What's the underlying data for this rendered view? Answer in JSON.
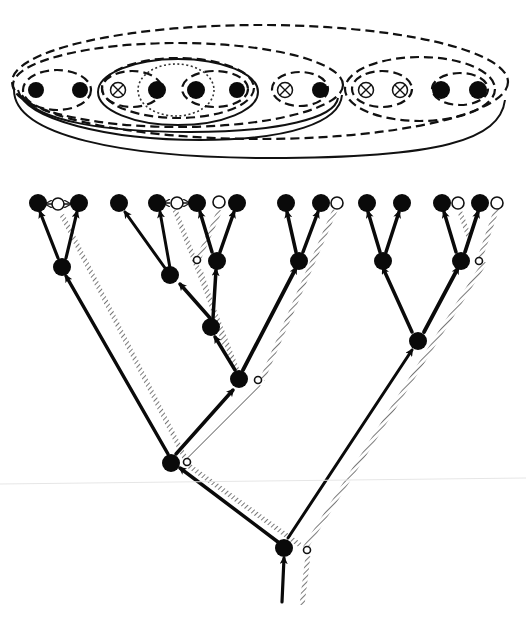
{
  "figure": {
    "top_panel": {
      "name": "nested-set-diagram",
      "groups": [
        {
          "id": "outer",
          "style": "dashed",
          "members": "all"
        },
        {
          "id": "left-major",
          "style": "solid-double",
          "members": [
            "A",
            "B",
            "C",
            "D",
            "E",
            "F",
            "G",
            "H"
          ]
        },
        {
          "id": "AB",
          "style": "dashed+hatched",
          "members": [
            "A",
            "B"
          ]
        },
        {
          "id": "CDEF",
          "style": "solid+dashed",
          "members": [
            "C",
            "D",
            "E",
            "F"
          ]
        },
        {
          "id": "CD",
          "style": "dashed",
          "members": [
            "C",
            "D"
          ]
        },
        {
          "id": "EF",
          "style": "dashed",
          "members": [
            "E",
            "F"
          ]
        },
        {
          "id": "DE",
          "style": "dotted+stippled",
          "members": [
            "D",
            "E"
          ]
        },
        {
          "id": "GH",
          "style": "dashed",
          "members": [
            "G",
            "H"
          ]
        },
        {
          "id": "right-major",
          "style": "dashed",
          "members": [
            "I",
            "J",
            "K",
            "L"
          ]
        },
        {
          "id": "IJ",
          "style": "dashed",
          "members": [
            "I",
            "J"
          ]
        },
        {
          "id": "KL",
          "style": "dashed+hatched",
          "members": [
            "K",
            "L"
          ]
        }
      ],
      "taxa": [
        {
          "id": "A",
          "symbol": "filled"
        },
        {
          "id": "B",
          "symbol": "filled"
        },
        {
          "id": "C",
          "symbol": "crossed-circle"
        },
        {
          "id": "D",
          "symbol": "filled"
        },
        {
          "id": "E",
          "symbol": "filled"
        },
        {
          "id": "F",
          "symbol": "filled"
        },
        {
          "id": "G",
          "symbol": "crossed-circle"
        },
        {
          "id": "H",
          "symbol": "filled"
        },
        {
          "id": "I",
          "symbol": "crossed-circle"
        },
        {
          "id": "J",
          "symbol": "crossed-circle"
        },
        {
          "id": "K",
          "symbol": "filled"
        },
        {
          "id": "L",
          "symbol": "filled"
        }
      ]
    },
    "bottom_panel": {
      "name": "cladogram",
      "legend": {
        "filled_node": "observed taxon / ancestor",
        "open_node": "hypothetical / missing taxon",
        "solid_arrow": "lineage",
        "hatched_arrow": "character transformation path"
      },
      "colors": {
        "ink": "#0a0a0a",
        "hatch": "#8a8a8a",
        "background": "#ffffff"
      }
    }
  }
}
